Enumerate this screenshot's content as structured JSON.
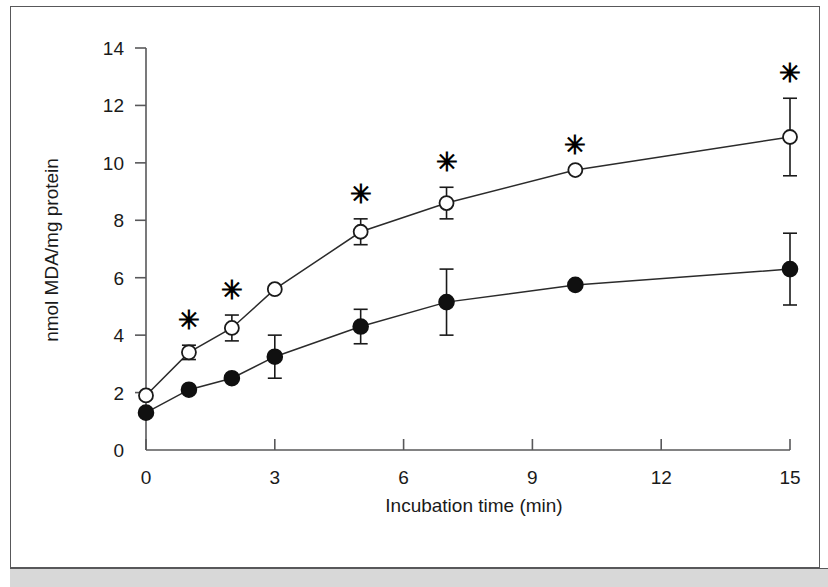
{
  "figure": {
    "frame_color": "#58585a",
    "band_color": "#d8d8d8",
    "background": "#ffffff"
  },
  "chart_data": {
    "type": "line",
    "title": "",
    "xlabel": "Incubation time (min)",
    "ylabel": "nmol MDA/mg protein",
    "xlim": [
      0,
      15
    ],
    "ylim": [
      0,
      14
    ],
    "xticks": [
      0,
      3,
      6,
      9,
      12,
      15
    ],
    "xticklabels": [
      "0",
      "3",
      "6",
      "9",
      "12",
      "15"
    ],
    "yticks": [
      0,
      2,
      4,
      6,
      8,
      10,
      12,
      14
    ],
    "yticklabels": [
      "0",
      "2",
      "4",
      "6",
      "8",
      "10",
      "12",
      "14"
    ],
    "grid": false,
    "legend": "none",
    "marker_colors": {
      "open": "#ffffff",
      "filled": "#101010",
      "line": "#2b2b2b"
    },
    "annotation_symbol": "✳",
    "annotation_note": "asterisk denotes statistically significant difference",
    "x": [
      0,
      1,
      2,
      3,
      5,
      7,
      10,
      15
    ],
    "series": [
      {
        "name": "open-circle-series",
        "marker": "open-circle",
        "values": [
          1.9,
          3.4,
          4.25,
          5.6,
          7.6,
          8.6,
          9.75,
          10.9
        ],
        "errors": [
          0,
          0.25,
          0.45,
          0,
          0.45,
          0.55,
          0,
          1.35
        ],
        "significance": [
          false,
          true,
          true,
          false,
          true,
          true,
          true,
          true
        ]
      },
      {
        "name": "filled-circle-series",
        "marker": "filled-circle",
        "values": [
          1.3,
          2.1,
          2.5,
          3.25,
          4.3,
          5.15,
          5.75,
          6.3
        ],
        "errors": [
          0,
          0,
          0,
          0.75,
          0.6,
          1.15,
          0,
          1.25
        ],
        "significance": [
          false,
          false,
          false,
          false,
          false,
          false,
          false,
          false
        ]
      }
    ]
  }
}
